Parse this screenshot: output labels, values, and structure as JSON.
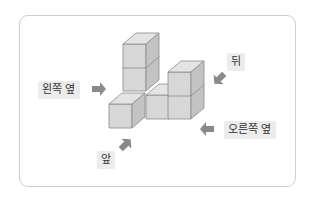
{
  "diagram": {
    "type": "isometric-cube-structure",
    "cube_count": 6,
    "colors": {
      "cube_front": "#d7d7d7",
      "cube_top": "#e4e4e4",
      "cube_side": "#c3c3c3",
      "edge": "#8c8c8c",
      "arrow": "#8a8a8a",
      "label_bg": "#ececec",
      "card_border": "#cfcfcf"
    },
    "labels": {
      "left_side": "왼쪽 옆",
      "back": "뒤",
      "right_side": "오른쪽 옆",
      "front": "앞"
    }
  }
}
